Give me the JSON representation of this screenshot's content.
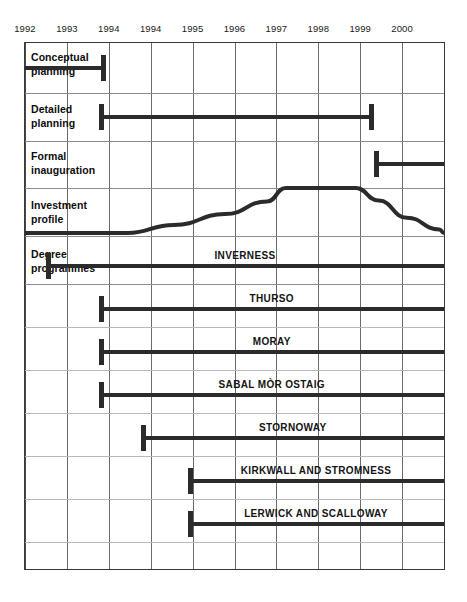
{
  "chart_data": {
    "type": "bar",
    "title": "",
    "xlabel": "",
    "ylabel": "",
    "grid": true,
    "legend_position": "none",
    "axis": {
      "tick_labels": [
        "1992",
        "1993",
        "1994",
        "1994",
        "1995",
        "1996",
        "1997",
        "1998",
        "1999",
        "2000"
      ],
      "x_start": 1992,
      "x_end": 2001,
      "columns": 10
    },
    "sections": [
      {
        "label": "Conceptual planning",
        "bars": [
          {
            "name": "conceptual-planning",
            "start": 1992.0,
            "end": 1993.75,
            "start_cap": false,
            "end_cap": true
          }
        ]
      },
      {
        "label": "Detailed planning",
        "bars": [
          {
            "name": "detailed-planning",
            "start": 1993.6,
            "end": 1999.5,
            "start_cap": true,
            "end_cap": true
          }
        ]
      },
      {
        "label": "Formal inauguration",
        "bars": [
          {
            "name": "formal-inauguration",
            "start": 1999.5,
            "end": 2001.9,
            "start_cap": true,
            "end_cap": false
          }
        ]
      },
      {
        "label": "Investment profile",
        "curve": {
          "name": "investment-profile-curve",
          "baseline_value": 0,
          "peak_value": 100,
          "points": [
            {
              "x": 1992.0,
              "y": 0
            },
            {
              "x": 1994.2,
              "y": 0
            },
            {
              "x": 1995.2,
              "y": 18
            },
            {
              "x": 1996.3,
              "y": 42
            },
            {
              "x": 1997.2,
              "y": 70
            },
            {
              "x": 1997.6,
              "y": 100
            },
            {
              "x": 1999.1,
              "y": 100
            },
            {
              "x": 1999.6,
              "y": 72
            },
            {
              "x": 2000.2,
              "y": 34
            },
            {
              "x": 2000.9,
              "y": 8
            },
            {
              "x": 2001.3,
              "y": 0
            },
            {
              "x": 2001.5,
              "y": 0
            }
          ]
        }
      },
      {
        "label": "Degree programmes",
        "bars": [
          {
            "name": "inverness",
            "title": "INVERNESS",
            "start": 1992.45,
            "end": 2002.0,
            "start_cap": true,
            "end_cap": false
          },
          {
            "name": "thurso",
            "title": "THURSO",
            "start": 1993.6,
            "end": 2002.0,
            "start_cap": true,
            "end_cap": false
          },
          {
            "name": "moray",
            "title": "MORAY",
            "start": 1993.6,
            "end": 2002.0,
            "start_cap": true,
            "end_cap": false
          },
          {
            "name": "sabal-mor-ostaig",
            "title": "SABAL MÒR OSTAIG",
            "start": 1993.6,
            "end": 2002.0,
            "start_cap": true,
            "end_cap": false
          },
          {
            "name": "stornoway",
            "title": "STORNOWAY",
            "start": 1994.5,
            "end": 2002.0,
            "start_cap": true,
            "end_cap": false
          },
          {
            "name": "kirkwall-and-stromness",
            "title": "KIRKWALL AND STROMNESS",
            "start": 1995.5,
            "end": 2002.0,
            "start_cap": true,
            "end_cap": false
          },
          {
            "name": "lerwick-and-scalloway",
            "title": "LERWICK AND SCALLOWAY",
            "start": 1995.5,
            "end": 2002.0,
            "start_cap": true,
            "end_cap": false
          }
        ]
      }
    ],
    "colors": {
      "bar": "#2b2b2b",
      "curve": "#2b2b2b",
      "grid_line": "#6b6b6b",
      "row_divider": "#b8b8b8",
      "frame": "#3a3a3a",
      "background": "#ffffff",
      "text": "#0d0d0d"
    }
  },
  "rows": {
    "conceptual_planning": "Conceptual\nplanning",
    "detailed_planning": "Detailed\nplanning",
    "formal_inauguration": "Formal\ninauguration",
    "investment_profile": "Investment\nprofile",
    "degree_programmes": "Degree\nprogrammes"
  }
}
